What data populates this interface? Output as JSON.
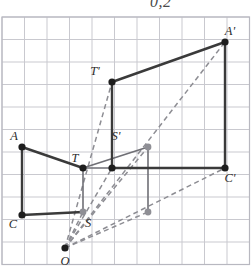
{
  "caption": {
    "text": "0,2"
  },
  "figure": {
    "grid": {
      "cell_px": 22.5,
      "origin_x": 2,
      "origin_y": 17,
      "cols": 11,
      "rows": 11,
      "line_color": "#c9c9cf",
      "border_color": "#b8b8c0"
    },
    "colors": {
      "solid_stroke": "#3a3a3a",
      "dashed_stroke": "#8d8d93",
      "gray_point": "#8f8f95",
      "black_point": "#1d1d1d",
      "label_text": "#2b2b2b",
      "grid_line": "#c9c9cf"
    },
    "points": [
      {
        "id": "O",
        "label": "O",
        "x": 65,
        "y": 248,
        "kind": "black",
        "label_dx": 0,
        "label_dy": 17
      },
      {
        "id": "A",
        "label": "A",
        "x": 22,
        "y": 147,
        "kind": "black",
        "label_dx": -8,
        "label_dy": -7
      },
      {
        "id": "C",
        "label": "C",
        "x": 22,
        "y": 215,
        "kind": "black",
        "label_dx": -9,
        "label_dy": 13
      },
      {
        "id": "T",
        "label": "T",
        "x": 83,
        "y": 168,
        "kind": "black",
        "label_dx": -8,
        "label_dy": -6
      },
      {
        "id": "S",
        "label": "S",
        "x": 83,
        "y": 212,
        "kind": "gray",
        "label_dx": 5,
        "label_dy": 15
      },
      {
        "id": "B",
        "label": "",
        "x": 112,
        "y": 168,
        "kind": "black",
        "label_dx": 0,
        "label_dy": 0
      },
      {
        "id": "Sp",
        "label": "S'",
        "x": 148,
        "y": 147,
        "kind": "gray",
        "label_dx": -32,
        "label_dy": -7
      },
      {
        "id": "D",
        "label": "",
        "x": 148,
        "y": 212,
        "kind": "gray",
        "label_dx": 0,
        "label_dy": 0
      },
      {
        "id": "Tp",
        "label": "T'",
        "x": 112,
        "y": 82,
        "kind": "black",
        "label_dx": -17,
        "label_dy": -7
      },
      {
        "id": "Ap",
        "label": "A'",
        "x": 225,
        "y": 42,
        "kind": "black",
        "label_dx": 5,
        "label_dy": -7
      },
      {
        "id": "Cp",
        "label": "C'",
        "x": 225,
        "y": 168,
        "kind": "black",
        "label_dx": 5,
        "label_dy": 14
      }
    ],
    "solid_segments": [
      {
        "name": "A-to-C",
        "x1": 22,
        "y1": 147,
        "x2": 22,
        "y2": 215
      },
      {
        "name": "C-to-S",
        "x1": 22,
        "y1": 215,
        "x2": 83,
        "y2": 212
      },
      {
        "name": "A-to-T",
        "x1": 22,
        "y1": 147,
        "x2": 83,
        "y2": 168
      },
      {
        "name": "T-to-S",
        "x1": 83,
        "y1": 168,
        "x2": 83,
        "y2": 212
      },
      {
        "name": "T-to-B",
        "x1": 83,
        "y1": 168,
        "x2": 112,
        "y2": 168
      },
      {
        "name": "T-to-Sp",
        "x1": 83,
        "y1": 168,
        "x2": 148,
        "y2": 147
      },
      {
        "name": "Sp-to-D",
        "x1": 148,
        "y1": 147,
        "x2": 148,
        "y2": 212
      },
      {
        "name": "B-to-Cp",
        "x1": 112,
        "y1": 168,
        "x2": 225,
        "y2": 168
      },
      {
        "name": "Sp-vert-up",
        "x1": 112,
        "y1": 140,
        "x2": 112,
        "y2": 168
      },
      {
        "name": "Tp-to-B",
        "x1": 112,
        "y1": 82,
        "x2": 112,
        "y2": 168
      },
      {
        "name": "Tp-to-Ap",
        "x1": 112,
        "y1": 82,
        "x2": 225,
        "y2": 42
      },
      {
        "name": "Ap-to-Cp",
        "x1": 225,
        "y1": 42,
        "x2": 225,
        "y2": 168
      }
    ],
    "dashed_segments": [
      {
        "name": "O-to-Tp",
        "x1": 65,
        "y1": 248,
        "x2": 112,
        "y2": 82
      },
      {
        "name": "O-to-Ap",
        "x1": 65,
        "y1": 248,
        "x2": 225,
        "y2": 42
      },
      {
        "name": "O-to-Cp",
        "x1": 65,
        "y1": 248,
        "x2": 225,
        "y2": 168
      },
      {
        "name": "O-to-Sp",
        "x1": 65,
        "y1": 248,
        "x2": 148,
        "y2": 147
      },
      {
        "name": "O-to-D",
        "x1": 65,
        "y1": 248,
        "x2": 148,
        "y2": 212
      },
      {
        "name": "O-to-B",
        "x1": 65,
        "y1": 248,
        "x2": 112,
        "y2": 168
      },
      {
        "name": "O-to-S",
        "x1": 65,
        "y1": 248,
        "x2": 83,
        "y2": 212
      }
    ]
  }
}
